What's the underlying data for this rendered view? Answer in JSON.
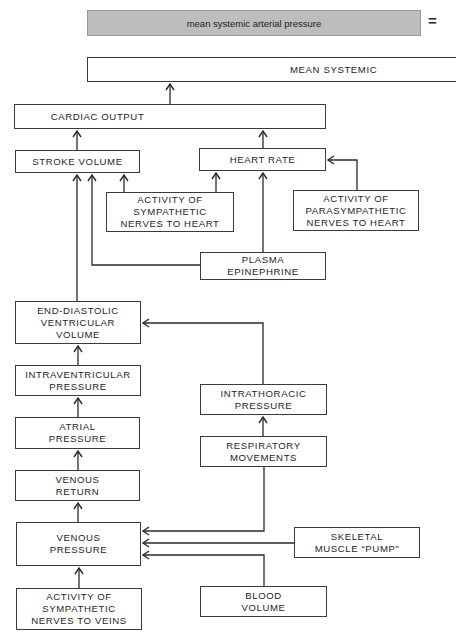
{
  "header": {
    "title": "mean systemic arterial pressure",
    "equals_sign": "=",
    "title_bg_color": "#bdbdbd"
  },
  "nodes": {
    "mean_systemic": "MEAN SYSTEMIC",
    "cardiac_output": "CARDIAC OUTPUT",
    "stroke_volume": "STROKE VOLUME",
    "heart_rate": "HEART RATE",
    "sympathetic_heart": "ACTIVITY OF\nSYMPATHETIC\nNERVES TO HEART",
    "parasympathetic_heart": "ACTIVITY OF\nPARASYMPATHETIC\nNERVES TO HEART",
    "plasma_epinephrine": "PLASMA\nEPINEPHRINE",
    "end_diastolic_volume": "END-DIASTOLIC\nVENTRICULAR\nVOLUME",
    "intraventricular_pressure": "INTRAVENTRICULAR\nPRESSURE",
    "atrial_pressure": "ATRIAL\nPRESSURE",
    "venous_return": "VENOUS\nRETURN",
    "venous_pressure": "VENOUS\nPRESSURE",
    "sympathetic_veins": "ACTIVITY OF\nSYMPATHETIC\nNERVES TO VEINS",
    "intrathoracic_pressure": "INTRATHORACIC\nPRESSURE",
    "respiratory_movements": "RESPIRATORY\nMOVEMENTS",
    "skeletal_muscle_pump": "SKELETAL\nMUSCLE “PUMP”",
    "blood_volume": "BLOOD\nVOLUME"
  },
  "edges": [
    {
      "from": "cardiac_output",
      "to": "mean_systemic"
    },
    {
      "from": "stroke_volume",
      "to": "cardiac_output"
    },
    {
      "from": "heart_rate",
      "to": "cardiac_output"
    },
    {
      "from": "sympathetic_heart",
      "to": "stroke_volume"
    },
    {
      "from": "sympathetic_heart",
      "to": "heart_rate"
    },
    {
      "from": "parasympathetic_heart",
      "to": "heart_rate"
    },
    {
      "from": "plasma_epinephrine",
      "to": "stroke_volume"
    },
    {
      "from": "plasma_epinephrine",
      "to": "heart_rate"
    },
    {
      "from": "end_diastolic_volume",
      "to": "stroke_volume"
    },
    {
      "from": "intraventricular_pressure",
      "to": "end_diastolic_volume"
    },
    {
      "from": "intrathoracic_pressure",
      "to": "end_diastolic_volume"
    },
    {
      "from": "atrial_pressure",
      "to": "intraventricular_pressure"
    },
    {
      "from": "venous_return",
      "to": "atrial_pressure"
    },
    {
      "from": "venous_pressure",
      "to": "venous_return"
    },
    {
      "from": "respiratory_movements",
      "to": "intrathoracic_pressure"
    },
    {
      "from": "respiratory_movements",
      "to": "venous_pressure"
    },
    {
      "from": "skeletal_muscle_pump",
      "to": "venous_pressure"
    },
    {
      "from": "blood_volume",
      "to": "venous_pressure"
    },
    {
      "from": "sympathetic_veins",
      "to": "venous_pressure"
    }
  ]
}
